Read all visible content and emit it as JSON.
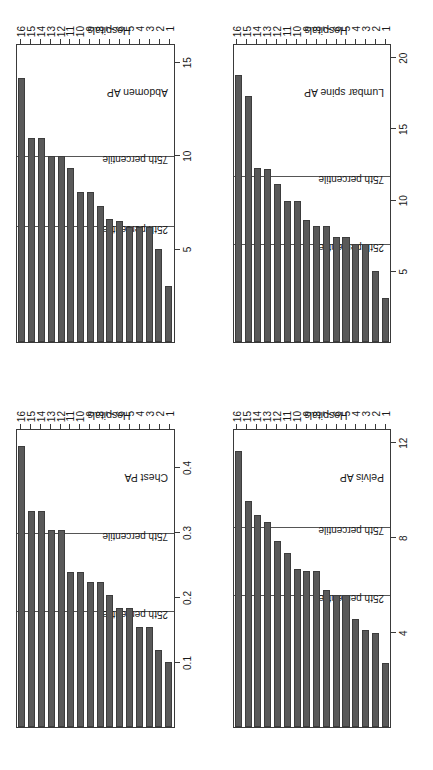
{
  "figure": {
    "bar_color": "#595959",
    "bar_border_color": "#3d3d3d",
    "axis_color": "#3a3a3a",
    "background": "#ffffff",
    "category_axis_label": "Hospitals",
    "value_axis_label_line1": "Mean entrance surface",
    "value_axis_label_line2": "dose (mGy)",
    "p25_label": "25th percentile",
    "p75_label": "75th percentile"
  },
  "chart_data": [
    {
      "type": "bar",
      "title": "Chest PA",
      "orientation": "horizontal",
      "xlabel": "Hospitals",
      "ylabel": "Mean entrance surface dose (mGy)",
      "categories": [
        "1",
        "2",
        "3",
        "4",
        "5",
        "6",
        "7",
        "8",
        "9",
        "10",
        "11",
        "12",
        "13",
        "14",
        "15",
        "16"
      ],
      "values": [
        0.1,
        0.12,
        0.155,
        0.155,
        0.185,
        0.185,
        0.205,
        0.225,
        0.225,
        0.24,
        0.24,
        0.305,
        0.305,
        0.335,
        0.335,
        0.435
      ],
      "ylim": [
        0,
        0.46
      ],
      "ticks": [
        0.1,
        0.2,
        0.3,
        0.4
      ],
      "tick_labels": [
        "0.1",
        "0.2",
        "0.3",
        "0.4"
      ],
      "p25": 0.1775,
      "p75": 0.2985,
      "grid": false,
      "legend": "none"
    },
    {
      "type": "bar",
      "title": "Abdomen AP",
      "orientation": "horizontal",
      "xlabel": "Hospitals",
      "ylabel": "Mean entrance surface dose (mGy)",
      "categories": [
        "1",
        "2",
        "3",
        "4",
        "5",
        "6",
        "7",
        "8",
        "9",
        "10",
        "11",
        "12",
        "13",
        "14",
        "15",
        "16"
      ],
      "values": [
        3.0,
        5.0,
        6.2,
        6.2,
        6.2,
        6.5,
        6.6,
        7.3,
        8.1,
        8.1,
        9.4,
        10.0,
        10.0,
        11.0,
        11.0,
        14.2
      ],
      "ylim": [
        0,
        16
      ],
      "ticks": [
        5,
        10,
        15
      ],
      "tick_labels": [
        "5",
        "10",
        "15"
      ],
      "p25": 6.2,
      "p75": 9.95,
      "grid": false,
      "legend": "none"
    },
    {
      "type": "bar",
      "title": "Pelvis AP",
      "orientation": "horizontal",
      "xlabel": "Hospitals",
      "ylabel": "Mean entrance surface dose (mGy)",
      "categories": [
        "1",
        "2",
        "3",
        "4",
        "5",
        "6",
        "7",
        "8",
        "9",
        "10",
        "11",
        "12",
        "13",
        "14",
        "15",
        "16"
      ],
      "values": [
        2.7,
        4.0,
        4.1,
        4.6,
        5.6,
        5.6,
        5.8,
        6.6,
        6.6,
        6.7,
        7.4,
        7.9,
        8.7,
        9.0,
        9.6,
        11.7
      ],
      "ylim": [
        0,
        12.6
      ],
      "ticks": [
        4,
        8,
        12
      ],
      "tick_labels": [
        "4",
        "8",
        "12"
      ],
      "p25": 5.55,
      "p75": 8.45,
      "grid": false,
      "legend": "none"
    },
    {
      "type": "bar",
      "title": "Lumbar spine AP",
      "orientation": "horizontal",
      "xlabel": "Hospitals",
      "ylabel": "Mean entrance surface dose (mGy)",
      "categories": [
        "1",
        "2",
        "3",
        "4",
        "5",
        "6",
        "7",
        "8",
        "9",
        "10",
        "11",
        "12",
        "13",
        "14",
        "15",
        "16"
      ],
      "values": [
        3.1,
        5.0,
        6.9,
        6.9,
        7.4,
        7.4,
        8.2,
        8.2,
        8.6,
        10.0,
        10.0,
        11.2,
        12.2,
        12.3,
        17.4,
        18.9
      ],
      "ylim": [
        0,
        21
      ],
      "ticks": [
        5,
        10,
        15,
        20
      ],
      "tick_labels": [
        "5",
        "10",
        "15",
        "20"
      ],
      "p25": 6.85,
      "p75": 11.7,
      "grid": false,
      "legend": "none"
    }
  ]
}
